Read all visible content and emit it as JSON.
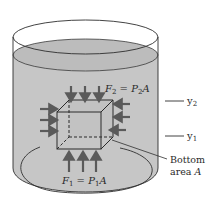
{
  "figure": {
    "type": "physics-diagram",
    "colors": {
      "fluid": "#c4c4c4",
      "fluid_surface": "#bdbdbd",
      "outline": "#2e2e2e",
      "arrow": "#5a5a5a",
      "background": "#ffffff"
    }
  },
  "labels": {
    "top_force": {
      "F": "F",
      "sub_f": "2",
      "eq": " = ",
      "P": "P",
      "sub_p": "2",
      "A": "A"
    },
    "bottom_force": {
      "F": "F",
      "sub_f": "1",
      "eq": " = ",
      "P": "P",
      "sub_p": "1",
      "A": "A"
    },
    "y2": {
      "y": "y",
      "sub": "2"
    },
    "y1": {
      "y": "y",
      "sub": "1"
    },
    "bottom_area": {
      "line1": "Bottom",
      "line2_prefix": "area ",
      "line2_var": "A"
    }
  }
}
